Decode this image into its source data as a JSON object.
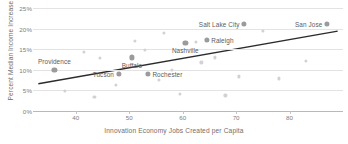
{
  "chart_data": {
    "type": "scatter",
    "title": "",
    "xlabel": "Innovation Economy Jobs Created per Capita",
    "ylabel": "Percent Median Income Increase",
    "xlim": [
      32,
      90
    ],
    "ylim": [
      0,
      25
    ],
    "xticks": [
      40,
      50,
      60,
      70,
      80
    ],
    "xtick_labels": [
      "40",
      "50",
      "60",
      "70",
      "80"
    ],
    "yticks": [
      0,
      5,
      10,
      15,
      20,
      25
    ],
    "ytick_labels": [
      "0%",
      "5%",
      "10%",
      "15%",
      "20%",
      "25%"
    ],
    "grid": "horizontal",
    "legend": "none",
    "colors": {
      "highlight_marker": "#9b9b9b",
      "faint_marker": "#d2d2d2",
      "trendline": "#2b2b2b",
      "gridline": "#e3e3e3",
      "axis": "#b9b9b9",
      "label_text": "#5c5c5c",
      "tick_text": "#7d7d7d"
    },
    "trendline": {
      "type": "linear",
      "x_start": 33,
      "y_start": 6.6,
      "x_end": 89,
      "y_end": 19.4
    },
    "labeled_points": [
      {
        "name": "Providence",
        "x": 36.0,
        "y": 10.0,
        "label_pos": "above"
      },
      {
        "name": "Tucson",
        "x": 48.0,
        "y": 9.1,
        "label_pos": "left"
      },
      {
        "name": "Buffalo",
        "x": 50.5,
        "y": 13.0,
        "label_pos": "below"
      },
      {
        "name": "Rochester",
        "x": 53.5,
        "y": 9.1,
        "label_pos": "right"
      },
      {
        "name": "Nashville",
        "x": 60.5,
        "y": 16.6,
        "label_pos": "below"
      },
      {
        "name": "Raleigh",
        "x": 64.5,
        "y": 17.2,
        "label_pos": "right"
      },
      {
        "name": "Salt Lake City",
        "x": 71.5,
        "y": 21.1,
        "label_pos": "left"
      },
      {
        "name": "San Jose",
        "x": 87.0,
        "y": 21.1,
        "label_pos": "left"
      }
    ],
    "unlabeled_points": [
      {
        "x": 38.0,
        "y": 4.9
      },
      {
        "x": 41.5,
        "y": 14.3
      },
      {
        "x": 43.5,
        "y": 3.4
      },
      {
        "x": 44.5,
        "y": 12.8
      },
      {
        "x": 47.5,
        "y": 6.4
      },
      {
        "x": 51.0,
        "y": 17.0
      },
      {
        "x": 53.0,
        "y": 14.8
      },
      {
        "x": 55.5,
        "y": 7.6
      },
      {
        "x": 56.5,
        "y": 19.0
      },
      {
        "x": 58.0,
        "y": 10.0
      },
      {
        "x": 59.5,
        "y": 4.1
      },
      {
        "x": 62.5,
        "y": 16.8
      },
      {
        "x": 63.5,
        "y": 11.8
      },
      {
        "x": 66.0,
        "y": 13.0
      },
      {
        "x": 68.0,
        "y": 3.8
      },
      {
        "x": 70.5,
        "y": 8.4
      },
      {
        "x": 75.0,
        "y": 19.4
      },
      {
        "x": 78.0,
        "y": 7.9
      },
      {
        "x": 83.0,
        "y": 12.1
      }
    ]
  }
}
